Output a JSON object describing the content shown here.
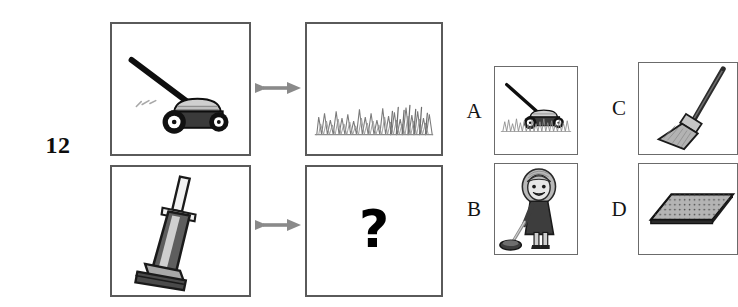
{
  "question": {
    "number": "12",
    "unknown_marker": "?",
    "type": "visual-analogy"
  },
  "stem": {
    "top_row": {
      "left_label": "lawn-mower",
      "relation_label": "leads-to",
      "right_label": "cut-grass-lawn"
    },
    "bottom_row": {
      "left_label": "upright-vacuum-cleaner",
      "relation_label": "leads-to",
      "right_label": "unknown"
    }
  },
  "options": [
    {
      "letter": "A",
      "label": "lawn-mower-on-grass"
    },
    {
      "letter": "B",
      "label": "girl-vacuuming"
    },
    {
      "letter": "C",
      "label": "broom"
    },
    {
      "letter": "D",
      "label": "rug-carpet"
    }
  ],
  "colors": {
    "frame": "#5a5a5a",
    "arrow": "#8a8a8a",
    "ink": "#141414",
    "grass": "#7d7d7d",
    "mower_body": "#3a3a3a",
    "mower_deck": "#c9c9c9",
    "vacuum_body": "#5e5e5e",
    "vacuum_light": "#d8d8d8",
    "background": "#ffffff"
  }
}
